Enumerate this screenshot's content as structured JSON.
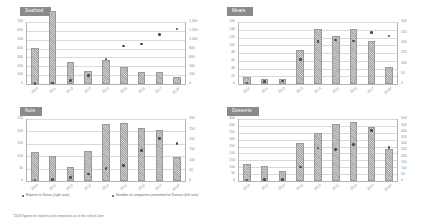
{
  "footnote": "*2018 figures for exports and companies as of the end of June",
  "legend": {
    "bars_label": "Exports to Korea (right axis)",
    "markers_label": "Number of companies permitted for Korean (left axis)"
  },
  "chart_data": [
    {
      "type": "bar",
      "title": "Seafood",
      "categories": [
        "2010",
        "2011",
        "2012",
        "2013",
        "2014",
        "2015",
        "2016",
        "2017",
        "2018*"
      ],
      "series": [
        {
          "name": "Exports to Korea (right axis)",
          "kind": "bar",
          "values": [
            410,
            820,
            250,
            150,
            275,
            190,
            135,
            140,
            75
          ],
          "axis": "left"
        },
        {
          "name": "Number of companies permitted for Korean (left axis)",
          "kind": "scatter",
          "values": [
            10,
            20,
            85,
            195,
            565,
            855,
            900,
            1115,
            1240
          ],
          "axis": "right"
        }
      ],
      "xlabel": "",
      "ylabel": "",
      "ylim": [
        0,
        700
      ],
      "yticks": [
        "0",
        "100",
        "200",
        "300",
        "400",
        "500",
        "600",
        "700"
      ],
      "ylim_right": [
        0,
        1400
      ],
      "yticks_right": [
        "0",
        "200",
        "400",
        "600",
        "800",
        "1,000",
        "1,200",
        "1,400"
      ],
      "grid": true
    },
    {
      "type": "bar",
      "title": "Meats",
      "categories": [
        "2010",
        "2011",
        "2012",
        "2013",
        "2014",
        "2015",
        "2016",
        "2017",
        "2018*"
      ],
      "series": [
        {
          "name": "Exports to Korea (right axis)",
          "kind": "bar",
          "values": [
            18,
            12,
            12,
            88,
            142,
            125,
            142,
            112,
            45
          ],
          "axis": "left"
        },
        {
          "name": "Number of companies permitted for Korean (left axis)",
          "kind": "scatter",
          "values": [
            5,
            12,
            15,
            118,
            205,
            212,
            208,
            248,
            232
          ],
          "axis": "right"
        }
      ],
      "xlabel": "",
      "ylabel": "",
      "ylim": [
        0,
        160
      ],
      "yticks": [
        "0",
        "20",
        "40",
        "60",
        "80",
        "100",
        "120",
        "140",
        "160"
      ],
      "ylim_right": [
        0,
        300
      ],
      "yticks_right": [
        "0",
        "50",
        "100",
        "150",
        "200",
        "250",
        "300"
      ],
      "grid": true
    },
    {
      "type": "bar",
      "title": "Nuts",
      "categories": [
        "2010",
        "2011",
        "2012",
        "2013",
        "2014",
        "2015",
        "2016",
        "2017",
        "2018*"
      ],
      "series": [
        {
          "name": "Exports to Korea (right axis)",
          "kind": "bar",
          "values": [
            118,
            100,
            58,
            122,
            228,
            232,
            212,
            205,
            95
          ],
          "axis": "left"
        },
        {
          "name": "Number of companies permitted for Korean (left axis)",
          "kind": "scatter",
          "values": [
            4,
            6,
            18,
            33,
            60,
            75,
            148,
            205,
            182
          ],
          "axis": "right"
        }
      ],
      "xlabel": "",
      "ylabel": "",
      "ylim": [
        0,
        250
      ],
      "yticks": [
        "0",
        "50",
        "100",
        "150",
        "200",
        "250"
      ],
      "ylim_right": [
        0,
        300
      ],
      "yticks_right": [
        "0",
        "50",
        "100",
        "150",
        "200",
        "250",
        "300"
      ],
      "grid": true
    },
    {
      "type": "bar",
      "title": "Desserts",
      "categories": [
        "2010",
        "2011",
        "2012",
        "2013",
        "2014",
        "2015",
        "2016",
        "2017",
        "2018*"
      ],
      "series": [
        {
          "name": "Exports to Korea (right axis)",
          "kind": "bar",
          "values": [
            122,
            112,
            72,
            278,
            348,
            412,
            428,
            392,
            232
          ],
          "axis": "left"
        },
        {
          "name": "Number of companies permitted for Korean (left axis)",
          "kind": "scatter",
          "values": [
            8,
            10,
            12,
            112,
            265,
            252,
            292,
            408,
            268
          ],
          "axis": "right"
        }
      ],
      "xlabel": "",
      "ylabel": "",
      "ylim": [
        0,
        450
      ],
      "yticks": [
        "0",
        "50",
        "100",
        "150",
        "200",
        "250",
        "300",
        "350",
        "400",
        "450"
      ],
      "ylim_right": [
        0,
        500
      ],
      "yticks_right": [
        "0",
        "50",
        "100",
        "150",
        "200",
        "250",
        "300",
        "350",
        "400",
        "450",
        "500"
      ],
      "grid": true
    }
  ]
}
